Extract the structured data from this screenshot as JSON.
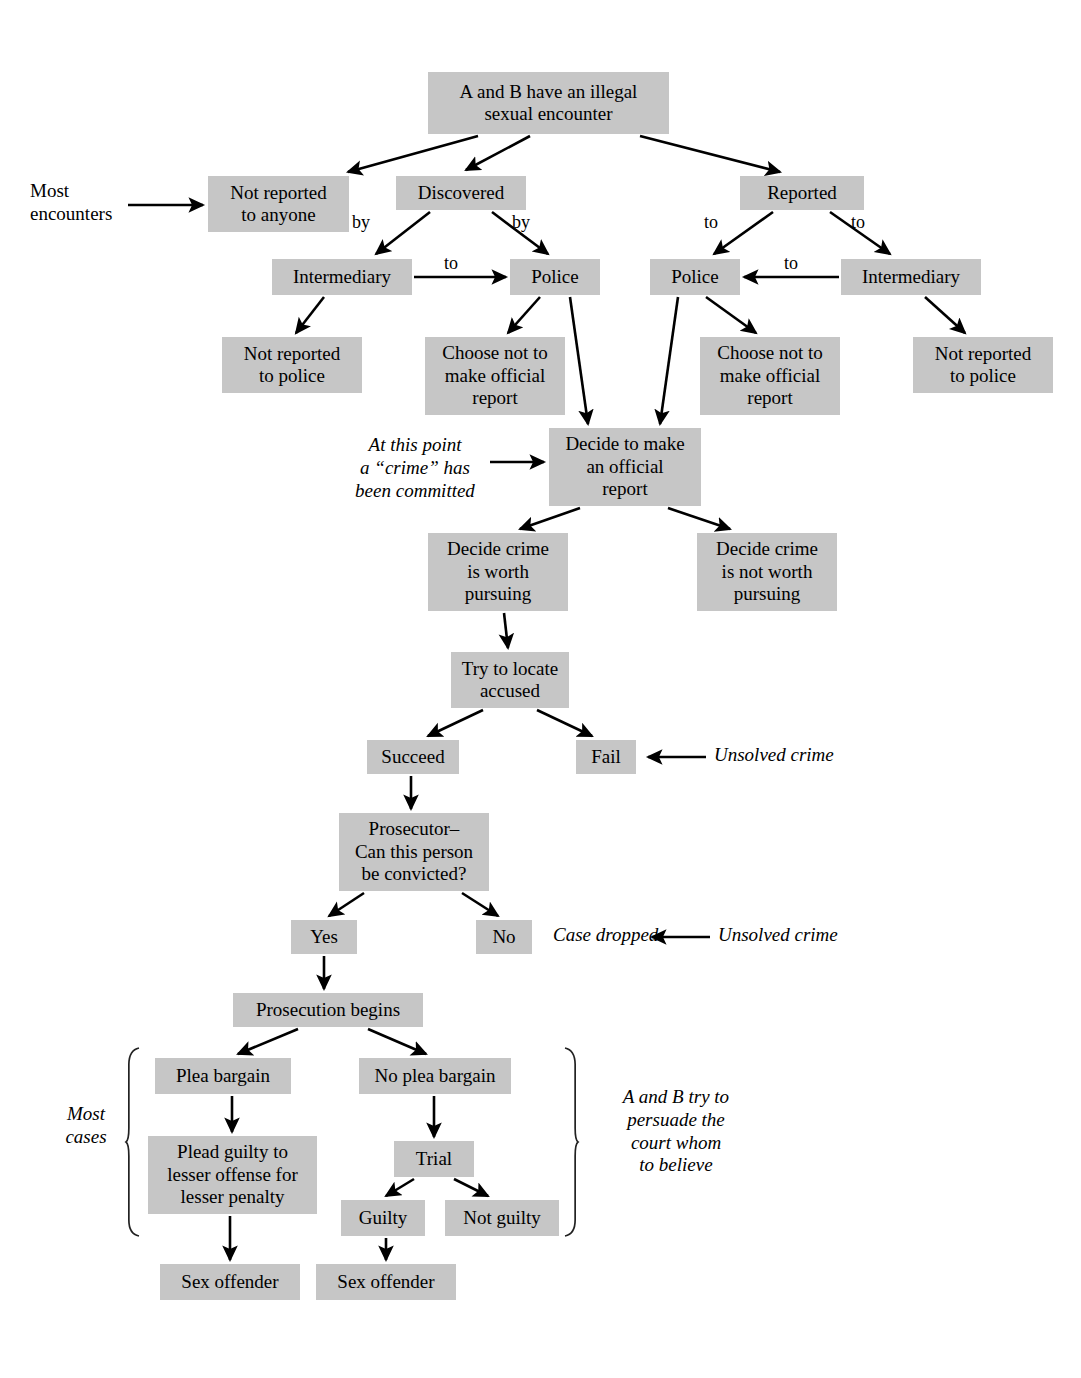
{
  "diagram": {
    "box_fill": "#c6c6c6",
    "stroke": "#000000",
    "background": "#ffffff",
    "nodes": [
      {
        "id": "n1",
        "label": "A and B have an illegal\nsexual encounter",
        "x": 428,
        "y": 72,
        "w": 241,
        "h": 62
      },
      {
        "id": "n2",
        "label": "Not reported\nto anyone",
        "x": 208,
        "y": 176,
        "w": 141,
        "h": 56
      },
      {
        "id": "n3",
        "label": "Discovered",
        "x": 396,
        "y": 176,
        "w": 130,
        "h": 34
      },
      {
        "id": "n4",
        "label": "Reported",
        "x": 740,
        "y": 176,
        "w": 124,
        "h": 34
      },
      {
        "id": "n5",
        "label": "Intermediary",
        "x": 272,
        "y": 259,
        "w": 140,
        "h": 36
      },
      {
        "id": "n6",
        "label": "Police",
        "x": 510,
        "y": 259,
        "w": 90,
        "h": 36
      },
      {
        "id": "n7",
        "label": "Police",
        "x": 650,
        "y": 259,
        "w": 90,
        "h": 36
      },
      {
        "id": "n8",
        "label": "Intermediary",
        "x": 841,
        "y": 259,
        "w": 140,
        "h": 36
      },
      {
        "id": "n9",
        "label": "Not reported\nto police",
        "x": 222,
        "y": 337,
        "w": 140,
        "h": 56
      },
      {
        "id": "n10",
        "label": "Choose not to\nmake official\nreport",
        "x": 425,
        "y": 337,
        "w": 140,
        "h": 78
      },
      {
        "id": "n11",
        "label": "Choose not to\nmake official\nreport",
        "x": 700,
        "y": 337,
        "w": 140,
        "h": 78
      },
      {
        "id": "n12",
        "label": "Not reported\nto police",
        "x": 913,
        "y": 337,
        "w": 140,
        "h": 56
      },
      {
        "id": "n13",
        "label": "Decide to make\nan official\nreport",
        "x": 549,
        "y": 428,
        "w": 152,
        "h": 78
      },
      {
        "id": "n14",
        "label": "Decide crime\nis worth\npursuing",
        "x": 428,
        "y": 533,
        "w": 140,
        "h": 78
      },
      {
        "id": "n15",
        "label": "Decide crime\nis not worth\npursuing",
        "x": 697,
        "y": 533,
        "w": 140,
        "h": 78
      },
      {
        "id": "n16",
        "label": "Try to locate\naccused",
        "x": 451,
        "y": 652,
        "w": 118,
        "h": 56
      },
      {
        "id": "n17",
        "label": "Succeed",
        "x": 367,
        "y": 740,
        "w": 92,
        "h": 34
      },
      {
        "id": "n18",
        "label": "Fail",
        "x": 576,
        "y": 740,
        "w": 60,
        "h": 34
      },
      {
        "id": "n19",
        "label": "Prosecutor–\nCan this person\nbe convicted?",
        "x": 339,
        "y": 813,
        "w": 150,
        "h": 78
      },
      {
        "id": "n20",
        "label": "Yes",
        "x": 291,
        "y": 920,
        "w": 66,
        "h": 34
      },
      {
        "id": "n21",
        "label": "No",
        "x": 476,
        "y": 920,
        "w": 56,
        "h": 34
      },
      {
        "id": "n22",
        "label": "Prosecution begins",
        "x": 233,
        "y": 993,
        "w": 190,
        "h": 34
      },
      {
        "id": "n23",
        "label": "Plea bargain",
        "x": 155,
        "y": 1058,
        "w": 136,
        "h": 36
      },
      {
        "id": "n24",
        "label": "No plea bargain",
        "x": 359,
        "y": 1058,
        "w": 152,
        "h": 36
      },
      {
        "id": "n25",
        "label": "Trial",
        "x": 394,
        "y": 1141,
        "w": 80,
        "h": 36
      },
      {
        "id": "n26",
        "label": "Plead guilty to\nlesser offense for\nlesser penalty",
        "x": 148,
        "y": 1136,
        "w": 169,
        "h": 78
      },
      {
        "id": "n27",
        "label": "Guilty",
        "x": 341,
        "y": 1200,
        "w": 84,
        "h": 36
      },
      {
        "id": "n28",
        "label": "Not guilty",
        "x": 445,
        "y": 1200,
        "w": 114,
        "h": 36
      },
      {
        "id": "n29",
        "label": "Sex offender",
        "x": 160,
        "y": 1264,
        "w": 140,
        "h": 36
      },
      {
        "id": "n30",
        "label": "Sex offender",
        "x": 316,
        "y": 1264,
        "w": 140,
        "h": 36
      }
    ],
    "edge_labels": [
      {
        "id": "el1",
        "text": "by",
        "x": 352,
        "y": 212
      },
      {
        "id": "el2",
        "text": "by",
        "x": 512,
        "y": 212
      },
      {
        "id": "el3",
        "text": "to",
        "x": 444,
        "y": 253
      },
      {
        "id": "el4",
        "text": "to",
        "x": 704,
        "y": 212
      },
      {
        "id": "el5",
        "text": "to",
        "x": 851,
        "y": 212
      },
      {
        "id": "el6",
        "text": "to",
        "x": 784,
        "y": 253
      }
    ],
    "annotations": [
      {
        "id": "a1",
        "text": "Most\nencounters",
        "x": 30,
        "y": 180,
        "w": 130,
        "style": "plain",
        "align": "left"
      },
      {
        "id": "a2",
        "text": "At this point\na “crime” has\nbeen committed",
        "x": 335,
        "y": 434,
        "w": 160,
        "style": "italic",
        "align": "center"
      },
      {
        "id": "a3",
        "text": "Unsolved crime",
        "x": 714,
        "y": 744,
        "w": 160,
        "style": "italic",
        "align": "left"
      },
      {
        "id": "a4",
        "text": "Case dropped",
        "x": 553,
        "y": 924,
        "w": 130,
        "style": "italic",
        "align": "left"
      },
      {
        "id": "a5",
        "text": "Unsolved crime",
        "x": 718,
        "y": 924,
        "w": 160,
        "style": "italic",
        "align": "left"
      },
      {
        "id": "a6",
        "text": "Most\ncases",
        "x": 48,
        "y": 1103,
        "w": 76,
        "style": "italic",
        "align": "center"
      },
      {
        "id": "a7",
        "text": "A and B try to\npersuade the\ncourt whom\nto believe",
        "x": 591,
        "y": 1086,
        "w": 170,
        "style": "italic",
        "align": "center"
      }
    ],
    "braces": [
      {
        "id": "b1",
        "side": "left",
        "x": 126,
        "y_top": 1048,
        "y_bottom": 1236
      },
      {
        "id": "b2",
        "side": "right",
        "x": 578,
        "y_top": 1048,
        "y_bottom": 1236
      }
    ],
    "edges": [
      {
        "from": "n1",
        "to": "n2",
        "d": "M 478 136 L 348 172"
      },
      {
        "from": "n1",
        "to": "n3",
        "d": "M 530 136 L 466 170"
      },
      {
        "from": "n1",
        "to": "n4",
        "d": "M 640 136 L 780 172"
      },
      {
        "from": "n3",
        "to": "n5",
        "d": "M 430 212 L 376 254"
      },
      {
        "from": "n3",
        "to": "n6",
        "d": "M 492 212 L 548 254"
      },
      {
        "from": "n5",
        "to": "n6",
        "d": "M 414 277 L 506 277"
      },
      {
        "from": "n4",
        "to": "n7",
        "d": "M 773 212 L 714 254"
      },
      {
        "from": "n4",
        "to": "n8",
        "d": "M 830 212 L 890 254"
      },
      {
        "from": "n8",
        "to": "n7",
        "d": "M 839 277 L 744 277"
      },
      {
        "from": "n5",
        "to": "n9",
        "d": "M 324 297 L 296 333"
      },
      {
        "from": "n6",
        "to": "n10",
        "d": "M 540 297 L 508 333"
      },
      {
        "from": "n6",
        "to": "n13",
        "d": "M 570 297 L 588 424"
      },
      {
        "from": "n7",
        "to": "n11",
        "d": "M 706 297 L 756 333"
      },
      {
        "from": "n7",
        "to": "n13",
        "d": "M 678 297 L 660 424"
      },
      {
        "from": "n8",
        "to": "n12",
        "d": "M 925 297 L 965 333"
      },
      {
        "from": "n13",
        "to": "n14",
        "d": "M 580 508 L 520 529"
      },
      {
        "from": "n13",
        "to": "n15",
        "d": "M 668 508 L 730 529"
      },
      {
        "from": "n14",
        "to": "n16",
        "d": "M 504 613 L 508 648"
      },
      {
        "from": "n16",
        "to": "n17",
        "d": "M 483 710 L 428 736"
      },
      {
        "from": "n16",
        "to": "n18",
        "d": "M 537 710 L 592 736"
      },
      {
        "from": "n17",
        "to": "n19",
        "d": "M 411 776 L 411 809"
      },
      {
        "from": "n19",
        "to": "n20",
        "d": "M 364 893 L 329 916"
      },
      {
        "from": "n19",
        "to": "n21",
        "d": "M 462 893 L 498 916"
      },
      {
        "from": "n20",
        "to": "n22",
        "d": "M 324 956 L 324 989"
      },
      {
        "from": "n22",
        "to": "n23",
        "d": "M 298 1029 L 238 1054"
      },
      {
        "from": "n22",
        "to": "n24",
        "d": "M 368 1029 L 426 1054"
      },
      {
        "from": "n23",
        "to": "n26",
        "d": "M 232 1096 L 232 1132"
      },
      {
        "from": "n24",
        "to": "n25",
        "d": "M 434 1096 L 434 1137"
      },
      {
        "from": "n25",
        "to": "n27",
        "d": "M 414 1179 L 386 1196"
      },
      {
        "from": "n25",
        "to": "n28",
        "d": "M 454 1179 L 488 1196"
      },
      {
        "from": "n26",
        "to": "n29",
        "d": "M 230 1216 L 230 1260"
      },
      {
        "from": "n27",
        "to": "n30",
        "d": "M 386 1238 L 386 1260"
      }
    ],
    "plain_arrows": [
      {
        "id": "pa1",
        "d": "M 128 205 L 203 205",
        "note": "most-encounters-arrow"
      },
      {
        "id": "pa2",
        "d": "M 490 462 L 544 462",
        "note": "at-this-point-arrow"
      },
      {
        "id": "pa3",
        "d": "M 706 757 L 648 757",
        "note": "unsolved-crime-fail-arrow"
      },
      {
        "id": "pa4",
        "d": "M 710 937 L 652 937",
        "note": "unsolved-crime-dropped-arrow"
      }
    ]
  }
}
